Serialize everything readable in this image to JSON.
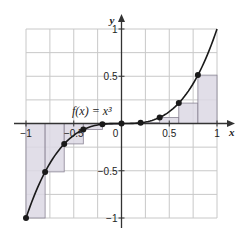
{
  "chart_data": {
    "type": "line",
    "title": "",
    "xlabel": "x",
    "ylabel": "y",
    "xlim": [
      -1,
      1
    ],
    "ylim": [
      -1,
      1
    ],
    "grid": true,
    "grid_step": 0.25,
    "x_ticks": [
      {
        "value": -1,
        "label": "−1"
      },
      {
        "value": -0.5,
        "label": "−0.5"
      },
      {
        "value": 0,
        "label": "0"
      },
      {
        "value": 0.5,
        "label": "0.5"
      },
      {
        "value": 1,
        "label": "1"
      }
    ],
    "y_ticks": [
      {
        "value": 1,
        "label": "1"
      },
      {
        "value": 0.5,
        "label": "0.5"
      },
      {
        "value": -0.5,
        "label": "−0.5"
      },
      {
        "value": -1,
        "label": "−1"
      }
    ],
    "function_label": "f(x) = x³",
    "function": "x^3",
    "rectangles": {
      "rule": "left-endpoint",
      "width": 0.2,
      "left_x": [
        -1,
        -0.8,
        -0.6,
        -0.4,
        -0.2,
        0,
        0.2,
        0.4,
        0.6,
        0.8
      ],
      "heights": [
        -1,
        -0.512,
        -0.216,
        -0.064,
        -0.008,
        0,
        0.008,
        0.064,
        0.216,
        0.512
      ]
    },
    "points": [
      {
        "x": -1,
        "y": -1
      },
      {
        "x": -0.8,
        "y": -0.512
      },
      {
        "x": -0.6,
        "y": -0.216
      },
      {
        "x": -0.4,
        "y": -0.064
      },
      {
        "x": -0.2,
        "y": -0.008
      },
      {
        "x": 0,
        "y": 0
      },
      {
        "x": 0.2,
        "y": 0.008
      },
      {
        "x": 0.4,
        "y": 0.064
      },
      {
        "x": 0.6,
        "y": 0.216
      },
      {
        "x": 0.8,
        "y": 0.512
      }
    ],
    "colors": {
      "rect_fill": "#dcd8e4",
      "rect_stroke": "#8a8494",
      "grid": "#c8c8c8",
      "curve": "#1a1a1a",
      "axis": "#333333"
    }
  }
}
